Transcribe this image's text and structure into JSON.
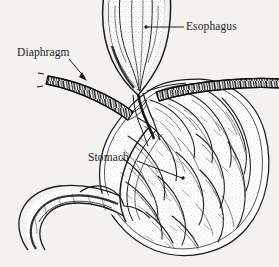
{
  "figure": {
    "style": "black-and-white stippled pen-and-ink anatomical line drawing",
    "width": 279,
    "height": 267,
    "background_color": "#f3f2f0",
    "ink_color": "#1b1b1b"
  },
  "labels": {
    "esophagus": {
      "text": "Esophagus",
      "x": 186,
      "y": 21,
      "leader": "horizontal line running left from the text to a dot inside the esophageal tube",
      "leader_from": [
        184,
        27
      ],
      "leader_to": [
        146,
        27
      ],
      "marker": "dot"
    },
    "diaphragm": {
      "text": "Diaphragm",
      "x": 17,
      "y": 47,
      "leader": "diagonal line running down-right from the text to an arrowhead on the left diaphragm band",
      "leader_from": [
        70,
        60
      ],
      "leader_to": [
        86,
        80
      ],
      "marker": "arrowhead"
    },
    "stomach": {
      "text": "Stomach",
      "x": 88,
      "y": 152,
      "leader": "line running down-right from the text to a dot inside the stomach rugae",
      "leader_from": [
        137,
        161
      ],
      "leader_to": [
        183,
        178
      ],
      "marker": "dot"
    }
  },
  "structures": [
    {
      "name": "esophagus",
      "description": "funnel-shaped tube entering from the top edge, widening downward, stippled interior with longitudinal mucosal folds"
    },
    {
      "name": "diaphragm",
      "description": "two hatched segmented muscle bands crossing the image left and right of the esophagus at the hiatus"
    },
    {
      "name": "gastroesophageal-junction",
      "description": "cardia where the esophagus meets the stomach, thick converging dark wall lines"
    },
    {
      "name": "stomach-body",
      "description": "large rounded sac on the right filled with dense wavy rugae and stipple"
    },
    {
      "name": "lesser-curvature",
      "description": "concave multi-line wall arc along the left side of the stomach"
    },
    {
      "name": "greater-curvature",
      "description": "smooth double-line outer wall around the right and bottom of the stomach"
    },
    {
      "name": "pylorus",
      "description": "narrowed outlet at the lower left of the stomach with a rounded bulge"
    },
    {
      "name": "duodenum",
      "description": "tube curving down and to the left from the pylorus, stippled interior"
    }
  ]
}
